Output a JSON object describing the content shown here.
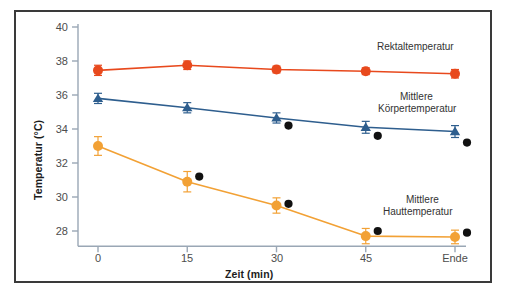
{
  "chart_data": {
    "type": "line",
    "title": "",
    "xlabel": "Zeit (min)",
    "ylabel": "Temperatur (°C)",
    "categories": [
      "0",
      "15",
      "30",
      "45",
      "Ende"
    ],
    "x": [
      0,
      15,
      30,
      45,
      60
    ],
    "xtick_labels": [
      "0",
      "15",
      "30",
      "45",
      "Ende"
    ],
    "ytick_labels": [
      "40",
      "38",
      "36",
      "34",
      "32",
      "30",
      "28"
    ],
    "yticks": [
      40,
      38,
      36,
      34,
      32,
      30,
      28
    ],
    "ylim": [
      27.0,
      40.0
    ],
    "grid": false,
    "legend_position": "inline-annotations",
    "series": [
      {
        "name": "Rektaltemperatur",
        "color": "#E8491D",
        "marker": "circle",
        "values": [
          37.45,
          37.75,
          37.5,
          37.4,
          37.25
        ],
        "errors": [
          0.3,
          0.25,
          0.2,
          0.2,
          0.25
        ]
      },
      {
        "name": "Mittlere Körpertemperatur",
        "color": "#2E5E8E",
        "marker": "triangle",
        "values": [
          35.8,
          35.25,
          34.65,
          34.1,
          33.85
        ],
        "errors": [
          0.3,
          0.3,
          0.3,
          0.35,
          0.35
        ]
      },
      {
        "name": "Mittlere Hauttemperatur",
        "color": "#F2A135",
        "marker": "circle",
        "values": [
          33.0,
          30.9,
          29.5,
          27.7,
          27.65
        ],
        "errors": [
          0.55,
          0.6,
          0.45,
          0.45,
          0.4
        ]
      },
      {
        "name": "Einzelwerte Körper",
        "color": "#111111",
        "marker": "circle-small",
        "x": [
          30,
          45,
          60
        ],
        "values": [
          34.2,
          33.6,
          33.2
        ],
        "errors": [
          0,
          0,
          0
        ]
      },
      {
        "name": "Einzelwerte Haut",
        "color": "#111111",
        "marker": "circle-small",
        "x": [
          15,
          30,
          45,
          60
        ],
        "values": [
          31.2,
          29.6,
          28.0,
          27.9
        ],
        "errors": [
          0,
          0,
          0,
          0
        ]
      }
    ],
    "annotations": [
      {
        "text": "Rektaltemperatur",
        "lines": [
          "Rektaltemperatur"
        ]
      },
      {
        "text": "Mittlere Körpertemperatur",
        "lines": [
          "Mittlere",
          "Körpertemperatur"
        ]
      },
      {
        "text": "Mittlere Hauttemperatur",
        "lines": [
          "Mittlere",
          "Hauttemperatur"
        ]
      }
    ]
  },
  "labels": {
    "ylabel": "Temperatur (°C)",
    "xlabel": "Zeit (min)",
    "ann_rektal": "Rektaltemperatur",
    "ann_koerper_1": "Mittlere",
    "ann_koerper_2": "Körpertemperatur",
    "ann_haut_1": "Mittlere",
    "ann_haut_2": "Hauttemperatur",
    "yt_40": "40",
    "yt_38": "38",
    "yt_36": "36",
    "yt_34": "34",
    "yt_32": "32",
    "yt_30": "30",
    "yt_28": "28",
    "xt_0": "0",
    "xt_15": "15",
    "xt_30": "30",
    "xt_45": "45",
    "xt_ende": "Ende"
  },
  "colors": {
    "rektal": "#E8491D",
    "koerper": "#2E5E8E",
    "haut": "#F2A135",
    "einzel": "#111111",
    "axis": "#9aa7b5",
    "border": "#3a3a3a"
  }
}
